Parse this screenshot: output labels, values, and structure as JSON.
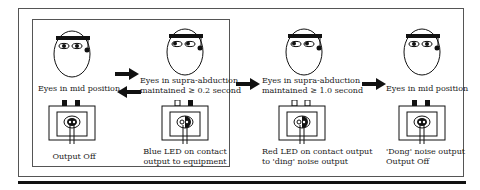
{
  "stages": [
    {
      "id": "stage-1",
      "face_caption": "Eyes in mid position",
      "device_caption": [
        "Output Off"
      ],
      "eyes": "mid",
      "device_tabs": "filled",
      "led": "none"
    },
    {
      "id": "stage-2",
      "face_caption": [
        "Eyes in supra-abduction",
        "maintained ≥ 0.2 second"
      ],
      "device_caption": [
        "Blue LED on contact",
        "output to equipment"
      ],
      "eyes": "supra",
      "device_tabs": "left-open",
      "led": "blue"
    },
    {
      "id": "stage-3",
      "face_caption": [
        "Eyes in supra-abduction",
        "maintained ≥ 1.0 second"
      ],
      "device_caption": [
        "Red LED on contact output",
        "to 'ding' noise output"
      ],
      "eyes": "supra",
      "device_tabs": "open",
      "led": "red"
    },
    {
      "id": "stage-4",
      "face_caption": "Eyes in mid position",
      "device_caption": [
        "'Dong' noise output",
        "Output Off"
      ],
      "eyes": "mid",
      "device_tabs": "filled",
      "led": "none"
    }
  ],
  "labels": {
    "s1_face": "Eyes in mid position",
    "s1_dev": "Output Off",
    "s2_face_1": "Eyes in supra-abduction",
    "s2_face_2": "maintained ≥ 0.2 second",
    "s2_dev_1": "Blue LED on contact",
    "s2_dev_2": "output to equipment",
    "s3_face_1": "Eyes in supra-abduction",
    "s3_face_2": "maintained ≥ 1.0 second",
    "s3_dev_1": "Red LED on contact output",
    "s3_dev_2": "to 'ding' noise output",
    "s4_face": "Eyes in mid position",
    "s4_dev_1": "'Dong' noise output",
    "s4_dev_2": "Output Off"
  },
  "arrows": [
    "right-arrow",
    "left-arrow",
    "right-arrow",
    "right-arrow"
  ]
}
